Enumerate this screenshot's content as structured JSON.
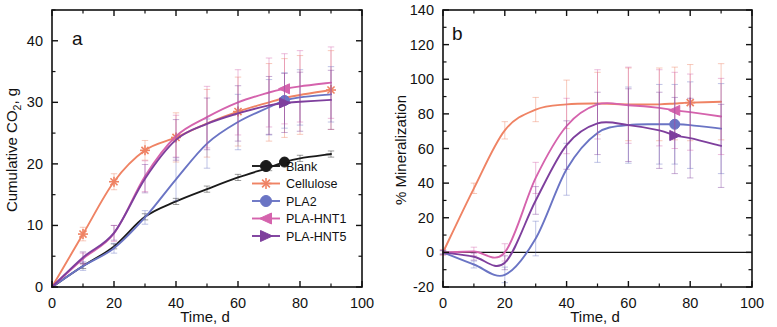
{
  "figure": {
    "panel_a_letter": "a",
    "panel_b_letter": "b"
  },
  "legend": {
    "items": [
      {
        "label": "Blank",
        "color": "#1a1a1a",
        "marker": "circle-marker"
      },
      {
        "label": "Cellulose",
        "color": "#ef8364",
        "marker": "asterisk-marker"
      },
      {
        "label": "PLA2",
        "color": "#6a74c4",
        "marker": "circle-marker"
      },
      {
        "label": "PLA-HNT1",
        "color": "#d563ad",
        "marker": "triangle-left-marker"
      },
      {
        "label": "PLA-HNT5",
        "color": "#7e3f9d",
        "marker": "triangle-right-marker"
      }
    ]
  },
  "chart_data": [
    {
      "type": "line",
      "panel": "a",
      "title": "a",
      "xlabel": "Time, d",
      "ylabel": "Cumulative CO2, g",
      "ylabel_sub": "2",
      "xlim": [
        0,
        100
      ],
      "ylim": [
        0,
        45
      ],
      "xticks": [
        0,
        20,
        40,
        60,
        80,
        100
      ],
      "yticks": [
        0,
        10,
        20,
        30,
        40
      ],
      "xminor": [
        10,
        30,
        50,
        70,
        90
      ],
      "yminor": [
        5,
        15,
        25,
        35,
        45
      ],
      "grid": false,
      "legend_position": "lower-right",
      "x": [
        0,
        10,
        20,
        30,
        40,
        50,
        60,
        70,
        75,
        80,
        90
      ],
      "series": [
        {
          "name": "Blank",
          "color": "#1a1a1a",
          "marker": "circle-marker",
          "values": [
            0,
            3.4,
            6.6,
            11.4,
            13.9,
            15.9,
            17.8,
            19.4,
            20.3,
            20.9,
            21.6
          ],
          "errors": [
            0,
            0.4,
            0.4,
            0.5,
            0.5,
            0.5,
            0.5,
            0.5,
            0.5,
            0.5,
            0.5
          ],
          "marker_points": [
            [
              75,
              20.3
            ]
          ]
        },
        {
          "name": "Cellulose",
          "color": "#ef8364",
          "marker": "asterisk-marker",
          "values": [
            0,
            8.6,
            17.1,
            22.2,
            24.3,
            26.6,
            28.5,
            30.0,
            30.7,
            31.2,
            32.0
          ],
          "errors": [
            0,
            1.1,
            1.3,
            1.6,
            4.0,
            5.5,
            5.6,
            6.3,
            6.4,
            6.4,
            6.4
          ],
          "marker_points": [
            [
              10,
              8.6
            ],
            [
              20,
              17.1
            ],
            [
              30,
              22.2
            ],
            [
              40,
              24.3
            ],
            [
              60,
              28.5
            ],
            [
              90,
              32.0
            ]
          ]
        },
        {
          "name": "PLA2",
          "color": "#6a74c4",
          "marker": "circle-marker",
          "values": [
            0,
            3.4,
            6.3,
            11.3,
            17.5,
            23.3,
            26.8,
            29.2,
            30.3,
            30.8,
            31.3
          ],
          "errors": [
            0,
            0.7,
            0.8,
            1.1,
            3.5,
            4.0,
            4.5,
            4.5,
            4.5,
            4.5,
            4.5
          ],
          "marker_points": [
            [
              75,
              30.3
            ]
          ]
        },
        {
          "name": "PLA-HNT1",
          "color": "#d563ad",
          "marker": "triangle-left-marker",
          "values": [
            0,
            4.6,
            8.7,
            18.0,
            24.5,
            27.6,
            30.0,
            31.6,
            32.2,
            32.6,
            33.2
          ],
          "errors": [
            0,
            0.9,
            1.3,
            2.5,
            3.4,
            5.0,
            5.3,
            5.6,
            5.7,
            5.8,
            5.8
          ],
          "marker_points": [
            [
              75,
              32.2
            ]
          ]
        },
        {
          "name": "PLA-HNT5",
          "color": "#7e3f9d",
          "marker": "triangle-right-marker",
          "values": [
            0,
            4.8,
            8.8,
            17.6,
            23.9,
            26.5,
            28.2,
            29.5,
            29.9,
            30.1,
            30.4
          ],
          "errors": [
            0,
            0.9,
            1.2,
            2.3,
            3.3,
            4.2,
            4.5,
            4.7,
            4.8,
            4.8,
            4.8
          ],
          "marker_points": [
            [
              75,
              29.9
            ]
          ]
        }
      ]
    },
    {
      "type": "line",
      "panel": "b",
      "title": "b",
      "xlabel": "Time, d",
      "ylabel": "% Mineralization",
      "xlim": [
        0,
        100
      ],
      "ylim": [
        -20,
        140
      ],
      "xticks": [
        0,
        20,
        40,
        60,
        80,
        100
      ],
      "yticks": [
        -20,
        0,
        20,
        40,
        60,
        80,
        100,
        120,
        140
      ],
      "xminor": [
        10,
        30,
        50,
        70,
        90
      ],
      "yminor": [
        -10,
        10,
        30,
        50,
        70,
        90,
        110,
        130
      ],
      "grid": false,
      "zero_line": 0,
      "x": [
        0,
        10,
        20,
        30,
        40,
        50,
        60,
        70,
        75,
        80,
        90
      ],
      "series": [
        {
          "name": "Cellulose",
          "color": "#ef8364",
          "marker": "asterisk-marker",
          "values": [
            0,
            37.0,
            70.5,
            82.5,
            85.5,
            86.0,
            85.5,
            85.5,
            86.0,
            86.5,
            87.0
          ],
          "errors": [
            1.5,
            3.0,
            5.0,
            7.0,
            14.0,
            18.0,
            21.0,
            21.0,
            21.0,
            22.0,
            22.0
          ],
          "marker_points": [
            [
              80,
              86.5
            ]
          ]
        },
        {
          "name": "PLA2",
          "color": "#6a74c4",
          "marker": "circle-marker",
          "values": [
            0,
            -7.0,
            -13.0,
            8.0,
            48.0,
            69.0,
            73.5,
            74.0,
            74.0,
            73.5,
            71.5
          ],
          "errors": [
            1.0,
            2.0,
            4.5,
            10.0,
            15.0,
            17.0,
            22.0,
            23.0,
            23.0,
            25.0,
            26.0
          ],
          "marker_points": [
            [
              75,
              74.0
            ]
          ]
        },
        {
          "name": "PLA-HNT1",
          "color": "#d563ad",
          "marker": "triangle-left-marker",
          "values": [
            0,
            0.5,
            0.0,
            43.0,
            73.0,
            85.5,
            85.0,
            83.5,
            82.0,
            81.0,
            78.5
          ],
          "errors": [
            1.5,
            2.5,
            5.0,
            9.0,
            16.0,
            20.0,
            22.0,
            22.0,
            22.0,
            22.0,
            22.0
          ],
          "marker_points": [
            [
              75,
              82.0
            ]
          ]
        },
        {
          "name": "PLA-HNT5",
          "color": "#7e3f9d",
          "marker": "triangle-right-marker",
          "values": [
            0,
            -2.5,
            -6.0,
            30.0,
            62.0,
            74.5,
            73.5,
            70.5,
            67.5,
            66.0,
            61.5
          ],
          "errors": [
            1.0,
            2.0,
            4.0,
            8.0,
            14.0,
            18.0,
            21.0,
            22.0,
            22.0,
            23.0,
            24.0
          ],
          "marker_points": [
            [
              75,
              67.5
            ]
          ]
        }
      ]
    }
  ]
}
